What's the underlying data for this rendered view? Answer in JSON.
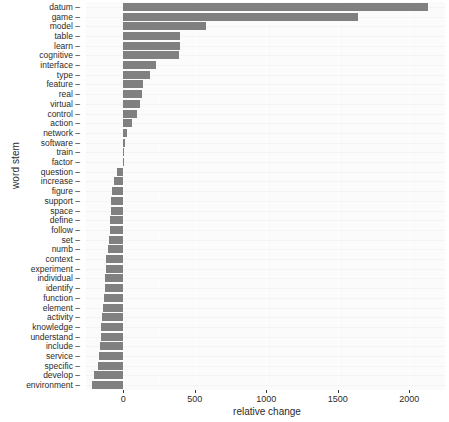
{
  "chart_data": {
    "type": "bar",
    "orientation": "horizontal",
    "title": "",
    "xlabel": "relative change",
    "ylabel": "word stem",
    "xlim": [
      -260,
      2250
    ],
    "xticks": [
      0,
      500,
      1000,
      1500,
      2000
    ],
    "xticklabels": [
      "0",
      "500",
      "1000",
      "1500",
      "2000"
    ],
    "grid": true,
    "legend": null,
    "bar_color": "#808080",
    "panel_color": "#fbfbfb",
    "categories": [
      "datum",
      "game",
      "model",
      "table",
      "learn",
      "cognitive",
      "interface",
      "type",
      "feature",
      "real",
      "virtual",
      "control",
      "action",
      "network",
      "software",
      "train",
      "factor",
      "question",
      "increase",
      "figure",
      "support",
      "space",
      "define",
      "follow",
      "set",
      "numb",
      "context",
      "experiment",
      "individual",
      "identify",
      "function",
      "element",
      "activity",
      "knowledge",
      "understand",
      "include",
      "service",
      "specific",
      "develop",
      "environment"
    ],
    "values": [
      2130,
      1640,
      580,
      400,
      395,
      390,
      230,
      185,
      140,
      130,
      120,
      95,
      60,
      30,
      12,
      4,
      -4,
      -45,
      -65,
      -80,
      -85,
      -88,
      -92,
      -95,
      -100,
      -105,
      -120,
      -122,
      -125,
      -128,
      -132,
      -140,
      -148,
      -152,
      -155,
      -160,
      -170,
      -178,
      -205,
      -215
    ]
  }
}
